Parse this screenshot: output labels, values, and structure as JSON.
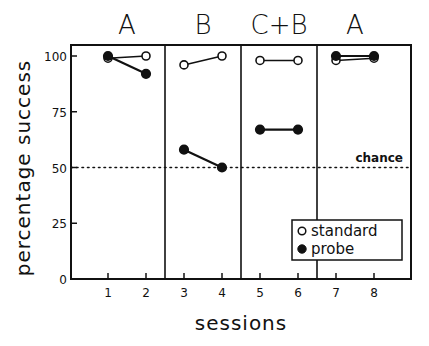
{
  "chart_data": {
    "type": "line",
    "title": "",
    "xlabel": "sessions",
    "ylabel": "percentage success",
    "ylim": [
      0,
      100
    ],
    "xlim": [
      0,
      9
    ],
    "x_ticks": [
      1,
      2,
      3,
      4,
      5,
      6,
      7,
      8
    ],
    "y_ticks": [
      0,
      25,
      50,
      75,
      100
    ],
    "grid": false,
    "phases": [
      {
        "label": "A",
        "sessions": [
          1,
          2
        ]
      },
      {
        "label": "B",
        "sessions": [
          3,
          4
        ]
      },
      {
        "label": "C+B",
        "sessions": [
          5,
          6
        ]
      },
      {
        "label": "A",
        "sessions": [
          7,
          8
        ]
      }
    ],
    "series": [
      {
        "name": "standard",
        "marker": "open-circle",
        "values": [
          99,
          100,
          96,
          100,
          98,
          98,
          98,
          99
        ]
      },
      {
        "name": "probe",
        "marker": "filled-circle",
        "values": [
          100,
          92,
          58,
          50,
          67,
          67,
          100,
          100
        ]
      }
    ],
    "reference_line": {
      "y": 50,
      "label": "chance",
      "style": "dotted"
    },
    "legend": {
      "position": "lower right",
      "entries": [
        "standard",
        "probe"
      ]
    }
  },
  "labels": {
    "xlabel": "sessions",
    "ylabel": "percentage success",
    "chance": "chance",
    "legend_standard": "standard",
    "legend_probe": "probe"
  }
}
